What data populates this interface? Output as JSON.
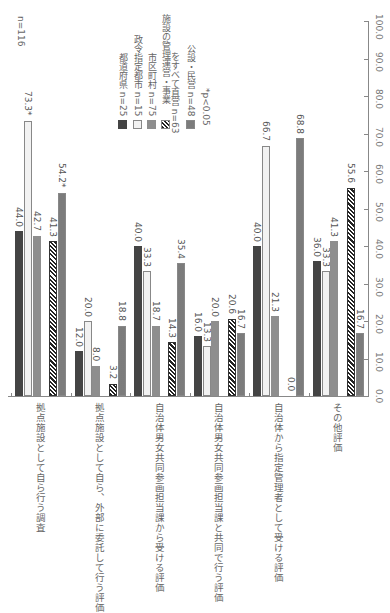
{
  "chart_data": {
    "type": "bar",
    "orientation": "rotated 90° clockwise (value axis on right, categories along bottom)",
    "title": "",
    "sample_label": "n=116",
    "categories": [
      "拠点施設として自ら行う調査",
      "拠点施設として自ら、外部に委託して行う評価",
      "自治体男女共同参画担当課から受ける評価",
      "自治体男女共同参画担当課と共同で行う評価",
      "自治体から指定管理者として受ける評価",
      "その他評価"
    ],
    "series": [
      {
        "name": "都道府県 n=25",
        "values": [
          44.0,
          12.0,
          40.0,
          16.0,
          40.0,
          36.0
        ],
        "labels": [
          "44.0",
          "12.0",
          "40.0",
          "16.0",
          "40.0",
          "36.0"
        ]
      },
      {
        "name": "政令指定都市 n=15",
        "values": [
          73.3,
          20.0,
          33.3,
          13.3,
          66.7,
          33.3
        ],
        "labels": [
          "73.3*",
          "20.0",
          "33.3",
          "13.3",
          "66.7",
          "33.3"
        ]
      },
      {
        "name": "市区町村 n=75",
        "values": [
          42.7,
          8.0,
          18.7,
          20.0,
          21.3,
          41.3
        ],
        "labels": [
          "42.7",
          "8.0",
          "18.7",
          "20.0",
          "21.3",
          "41.3"
        ]
      },
      {
        "name": "施設の管理運営・事業をすべて直営 n=63",
        "values": [
          41.3,
          3.2,
          14.3,
          20.6,
          0.0,
          55.6
        ],
        "labels": [
          "41.3",
          "3.2",
          "14.3",
          "20.6",
          "0.0",
          "55.6"
        ]
      },
      {
        "name": "公設・民営 n=48",
        "values": [
          54.2,
          18.8,
          35.4,
          16.7,
          68.8,
          16.7
        ],
        "labels": [
          "54.2*",
          "18.8",
          "35.4",
          "16.7",
          "68.8",
          "16.7"
        ]
      }
    ],
    "legend": [
      "都道府県 n=25",
      "政令指定都市 n=15",
      "市区町村 n=75",
      "施設の管理運営・事業をすべて直営 n=63",
      "公設・民営 n=48"
    ],
    "legend_lines": [
      [
        "都道府県 n=25"
      ],
      [
        "政令指定都市 n=15"
      ],
      [
        "市区町村 n=75"
      ],
      [
        "施設の管理運営・事業",
        "をすべて直営 n=63"
      ],
      [
        "公設・民営 n=48"
      ]
    ],
    "note": "*p<0.05",
    "axis_ticks": [
      "0.0",
      "10.0",
      "20.0",
      "30.0",
      "40.0",
      "50.0",
      "60.0",
      "70.0",
      "80.0",
      "90.0",
      "100.0"
    ],
    "ylim": [
      0,
      100
    ],
    "xlabel": "",
    "ylabel": "",
    "grid": false,
    "legend_position": "upper-left (rotated)",
    "colors": [
      "#444444",
      "#f2f2f2",
      "#8e8e8e",
      "hatched-black",
      "dotted-gray"
    ]
  }
}
